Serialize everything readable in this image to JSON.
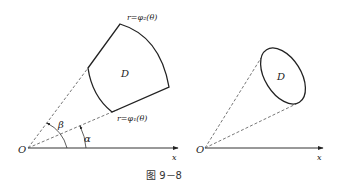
{
  "figure": {
    "caption": "图 9－8",
    "left_panel": {
      "origin_label": "O",
      "axis_label": "x",
      "region_label": "D",
      "outer_curve_label": "r=φ₂(θ)",
      "inner_curve_label": "r=φ₁(θ)",
      "angle_alpha_label": "α",
      "angle_beta_label": "β"
    },
    "right_panel": {
      "origin_label": "O",
      "axis_label": "x",
      "region_label": "D"
    }
  },
  "colors": {
    "stroke": "#222222",
    "dash": "#555555",
    "text": "#222222"
  }
}
